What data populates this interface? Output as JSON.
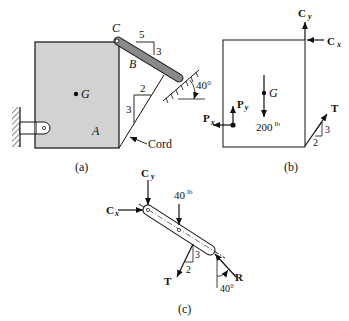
{
  "colors": {
    "block_fill": "#d2d2d2",
    "bar_fill": "#8a8a8a",
    "ink": "#111111"
  },
  "panel_a": {
    "caption": "(a)",
    "point_C": "C",
    "point_B": "B",
    "point_G": "G",
    "point_A": "A",
    "slope_bar": {
      "run": "5",
      "rise": "3"
    },
    "slope_cord": {
      "run": "2",
      "rise": "3"
    },
    "angle_surface": "40°",
    "cord_label": "Cord"
  },
  "panel_b": {
    "caption": "(b)",
    "force_Cy": {
      "main": "C",
      "sub": "y"
    },
    "force_Cx": {
      "main": "C",
      "sub": "x"
    },
    "force_Px": {
      "main": "P",
      "sub": "x"
    },
    "force_Py": {
      "main": "P",
      "sub": "y"
    },
    "point_G": "G",
    "weight": {
      "value": "200",
      "unit": "lb"
    },
    "force_T": "T",
    "slope_T": {
      "run": "2",
      "rise": "3"
    }
  },
  "panel_c": {
    "caption": "(c)",
    "force_Cy": {
      "main": "C",
      "sub": "y"
    },
    "force_Cx": {
      "main": "C",
      "sub": "x"
    },
    "weight": {
      "value": "40",
      "unit": "lb"
    },
    "force_T": "T",
    "slope_T": {
      "run": "2",
      "rise": "3"
    },
    "force_R": "R",
    "angle_R": "40°"
  }
}
